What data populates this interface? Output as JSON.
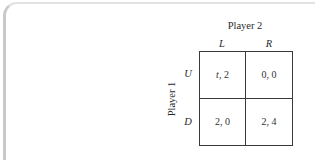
{
  "figure": {
    "type": "normal-form-game",
    "column_player": {
      "label": "Player 2",
      "strategies": [
        "L",
        "R"
      ]
    },
    "row_player": {
      "label": "Player 1",
      "strategies": [
        "U",
        "D"
      ]
    },
    "payoffs": [
      [
        {
          "p1": "t",
          "sep": ", ",
          "p2": "2",
          "p1_is_variable": true
        },
        {
          "p1": "0",
          "sep": ", ",
          "p2": "0",
          "p1_is_variable": false
        }
      ],
      [
        {
          "p1": "2",
          "sep": ", ",
          "p2": "0",
          "p1_is_variable": false
        },
        {
          "p1": "2",
          "sep": ", ",
          "p2": "4",
          "p1_is_variable": false
        }
      ]
    ]
  }
}
